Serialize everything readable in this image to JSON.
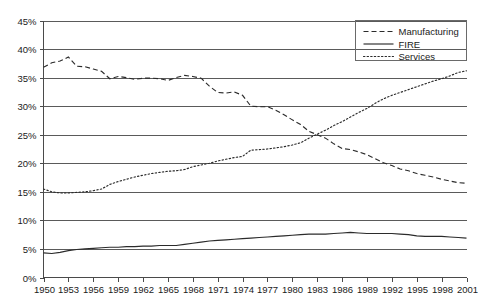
{
  "chart_data": {
    "type": "line",
    "title": "",
    "subtitle": "",
    "xlabel": "",
    "ylabel": "",
    "xlim": [
      1950,
      2001
    ],
    "ylim": [
      0,
      45
    ],
    "grid": true,
    "legend_position": "top-right",
    "y_ticks": [
      "0%",
      "5%",
      "10%",
      "15%",
      "20%",
      "25%",
      "30%",
      "35%",
      "40%",
      "45%"
    ],
    "y_tick_values": [
      0,
      5,
      10,
      15,
      20,
      25,
      30,
      35,
      40,
      45
    ],
    "x_tick_labels": [
      "1950",
      "1953",
      "1956",
      "1959",
      "1962",
      "1965",
      "1968",
      "1971",
      "1974",
      "1977",
      "1980",
      "1983",
      "1986",
      "1989",
      "1992",
      "1995",
      "1998",
      "2001"
    ],
    "x_tick_values": [
      1950,
      1953,
      1956,
      1959,
      1962,
      1965,
      1968,
      1971,
      1974,
      1977,
      1980,
      1983,
      1986,
      1989,
      1992,
      1995,
      1998,
      2001
    ],
    "x": [
      1950,
      1951,
      1952,
      1953,
      1954,
      1955,
      1956,
      1957,
      1958,
      1959,
      1960,
      1961,
      1962,
      1963,
      1964,
      1965,
      1966,
      1967,
      1968,
      1969,
      1970,
      1971,
      1972,
      1973,
      1974,
      1975,
      1976,
      1977,
      1978,
      1979,
      1980,
      1981,
      1982,
      1983,
      1984,
      1985,
      1986,
      1987,
      1988,
      1989,
      1990,
      1991,
      1992,
      1993,
      1994,
      1995,
      1996,
      1997,
      1998,
      1999,
      2000,
      2001
    ],
    "series": [
      {
        "name": "Manufacturing",
        "style": "dashed",
        "color": "#2b2b2b",
        "values": [
          36.8,
          37.6,
          37.9,
          38.6,
          37.0,
          36.9,
          36.5,
          36.1,
          34.8,
          35.2,
          35.0,
          34.7,
          34.9,
          34.9,
          34.8,
          34.5,
          35.0,
          35.4,
          35.2,
          34.9,
          33.5,
          32.4,
          32.3,
          32.5,
          31.9,
          30.0,
          29.9,
          29.9,
          29.3,
          28.5,
          27.6,
          26.8,
          25.6,
          25.0,
          24.4,
          23.4,
          22.6,
          22.4,
          22.0,
          21.5,
          20.8,
          20.1,
          19.6,
          19.0,
          18.7,
          18.2,
          17.9,
          17.6,
          17.2,
          16.9,
          16.6,
          16.5
        ]
      },
      {
        "name": "FIRE",
        "style": "solid",
        "color": "#2b2b2b",
        "values": [
          4.3,
          4.2,
          4.4,
          4.7,
          4.9,
          5.0,
          5.1,
          5.2,
          5.3,
          5.3,
          5.4,
          5.4,
          5.5,
          5.5,
          5.6,
          5.6,
          5.6,
          5.8,
          6.0,
          6.2,
          6.4,
          6.5,
          6.6,
          6.7,
          6.8,
          6.9,
          7.0,
          7.1,
          7.2,
          7.3,
          7.4,
          7.5,
          7.6,
          7.6,
          7.6,
          7.7,
          7.8,
          7.9,
          7.8,
          7.7,
          7.7,
          7.7,
          7.7,
          7.6,
          7.5,
          7.3,
          7.2,
          7.2,
          7.2,
          7.1,
          7.0,
          6.9
        ]
      },
      {
        "name": "Services",
        "style": "dotted",
        "color": "#2b2b2b",
        "values": [
          15.5,
          15.0,
          14.8,
          14.8,
          14.9,
          15.0,
          15.2,
          15.5,
          16.3,
          16.8,
          17.2,
          17.6,
          17.9,
          18.2,
          18.4,
          18.6,
          18.7,
          18.9,
          19.4,
          19.7,
          20.0,
          20.4,
          20.7,
          21.0,
          21.2,
          22.3,
          22.4,
          22.5,
          22.7,
          22.9,
          23.2,
          23.6,
          24.4,
          25.1,
          25.8,
          26.6,
          27.3,
          28.1,
          28.9,
          29.6,
          30.5,
          31.3,
          31.9,
          32.4,
          32.9,
          33.4,
          33.9,
          34.4,
          34.8,
          35.3,
          35.9,
          36.2
        ]
      }
    ]
  },
  "legend": {
    "items": [
      {
        "label": "Manufacturing",
        "style": "dashed"
      },
      {
        "label": "FIRE",
        "style": "solid"
      },
      {
        "label": "Services",
        "style": "dotted"
      }
    ]
  }
}
